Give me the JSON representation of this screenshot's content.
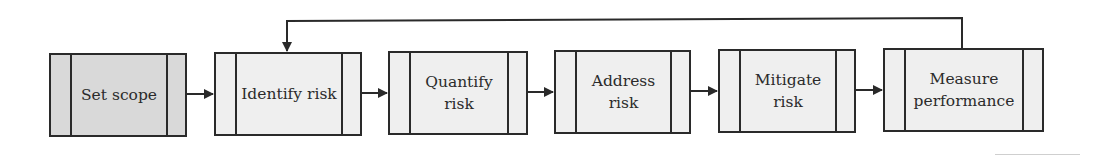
{
  "diagram": {
    "type": "process-flow",
    "steps": [
      {
        "id": "set-scope",
        "label": "Set scope",
        "shaded": true
      },
      {
        "id": "identify-risk",
        "label": "Identify risk",
        "shaded": false
      },
      {
        "id": "quantify-risk",
        "label": "Quantify risk",
        "shaded": false
      },
      {
        "id": "address-risk",
        "label": "Address risk",
        "shaded": false
      },
      {
        "id": "mitigate-risk",
        "label": "Mitigate risk",
        "shaded": false
      },
      {
        "id": "measure-performance",
        "label": "Measure performance",
        "shaded": false
      }
    ],
    "edges": [
      {
        "from": "set-scope",
        "to": "identify-risk"
      },
      {
        "from": "identify-risk",
        "to": "quantify-risk"
      },
      {
        "from": "quantify-risk",
        "to": "address-risk"
      },
      {
        "from": "address-risk",
        "to": "mitigate-risk"
      },
      {
        "from": "mitigate-risk",
        "to": "measure-performance"
      },
      {
        "from": "measure-performance",
        "to": "identify-risk",
        "kind": "feedback"
      }
    ],
    "colors": {
      "line": "#2a2a2a",
      "box_fill": "#efefef",
      "box_fill_shaded": "#d9d9d9",
      "text": "#2b2b2b"
    }
  },
  "labels": {
    "s0": "Set scope",
    "s1": "Identify risk",
    "s2a": "Quantify",
    "s2b": "risk",
    "s3a": "Address",
    "s3b": "risk",
    "s4a": "Mitigate",
    "s4b": "risk",
    "s5a": "Measure",
    "s5b": "performance"
  }
}
